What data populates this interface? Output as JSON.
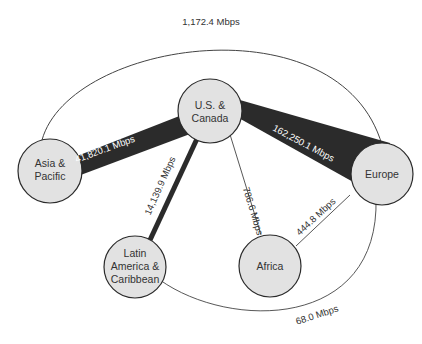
{
  "diagram": {
    "title": "",
    "colors": {
      "node_fill": "#e2e2e2",
      "node_stroke": "#2a2a2a",
      "thick_edge": "#2b2b2b",
      "thin_edge": "#444444",
      "background": "#ffffff"
    },
    "nodes": [
      {
        "id": "us_canada",
        "lines": [
          "U.S. &",
          "Canada"
        ]
      },
      {
        "id": "asia_pacific",
        "lines": [
          "Asia &",
          "Pacific"
        ]
      },
      {
        "id": "europe",
        "lines": [
          "Europe"
        ]
      },
      {
        "id": "latin_america",
        "lines": [
          "Latin",
          "America &",
          "Caribbean"
        ]
      },
      {
        "id": "africa",
        "lines": [
          "Africa"
        ]
      }
    ],
    "edges": [
      {
        "from": "us_canada",
        "to": "europe",
        "label": "162,250.1 Mbps"
      },
      {
        "from": "us_canada",
        "to": "asia_pacific",
        "label": "41,820.1 Mbps"
      },
      {
        "from": "us_canada",
        "to": "latin_america",
        "label": "14,139.9 Mbps"
      },
      {
        "from": "us_canada",
        "to": "africa",
        "label": "786.6 Mbps"
      },
      {
        "from": "europe",
        "to": "africa",
        "label": "444.8 Mbps"
      },
      {
        "from": "asia_pacific",
        "to": "europe",
        "label": "1,172.4 Mbps"
      },
      {
        "from": "latin_america",
        "to": "europe",
        "label": "68.0 Mbps"
      }
    ]
  }
}
